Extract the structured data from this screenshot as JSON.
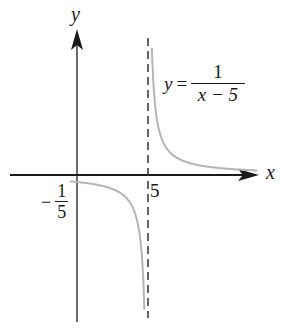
{
  "chart_data": {
    "type": "line",
    "title": "",
    "function": "y = 1/(x - 5)",
    "annotation": {
      "lhs": "y",
      "equals": "=",
      "numerator": "1",
      "denominator": "x − 5"
    },
    "xlabel": "x",
    "ylabel": "y",
    "tick_labels": {
      "x_intercept_marker": "5",
      "y_intercept": {
        "sign": "−",
        "numerator": "1",
        "denominator": "5"
      }
    },
    "vertical_asymptote": {
      "x": 5,
      "style": "dashed"
    },
    "horizontal_asymptote": {
      "y": 0
    },
    "y_intercept_value": -0.2,
    "series": [
      {
        "name": "left branch",
        "x": [
          -1,
          0,
          1,
          2,
          3,
          4,
          4.5,
          4.8,
          4.9
        ],
        "y": [
          -0.167,
          -0.2,
          -0.25,
          -0.333,
          -0.5,
          -1,
          -2,
          -5,
          -10
        ]
      },
      {
        "name": "right branch",
        "x": [
          5.1,
          5.2,
          5.5,
          6,
          7,
          8,
          9,
          10
        ],
        "y": [
          10,
          5,
          2,
          1,
          0.5,
          0.333,
          0.25,
          0.2
        ]
      }
    ],
    "grid": false,
    "legend": false,
    "colors": {
      "axes": "#1a1a1a",
      "curve": "#b5b5b5",
      "asymptote": "#333333"
    }
  }
}
